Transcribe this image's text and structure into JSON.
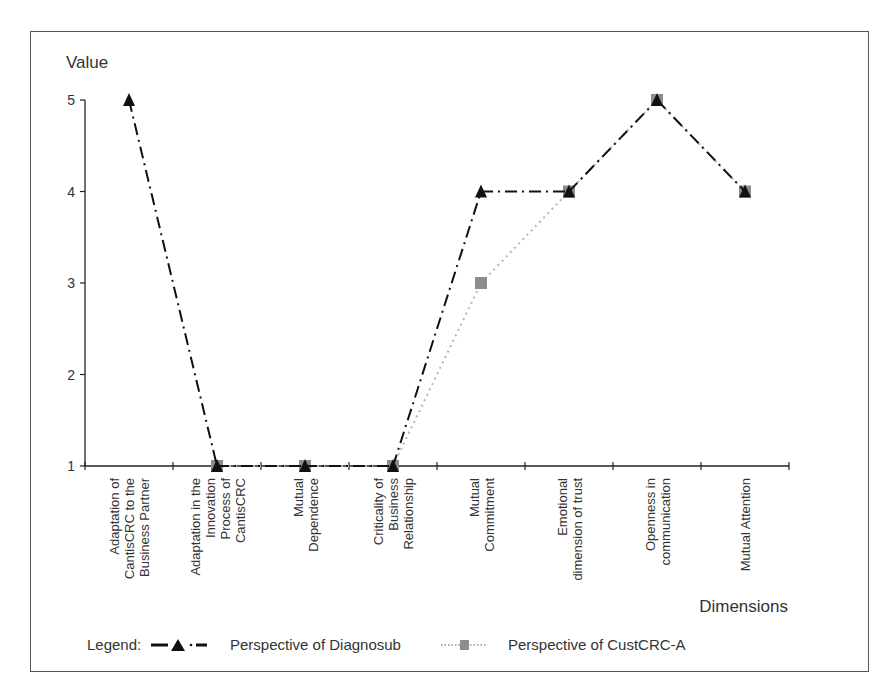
{
  "chart_data": {
    "type": "line",
    "title": "",
    "ylabel": "Value",
    "xlabel": "Dimensions",
    "ylim": [
      1,
      5
    ],
    "yticks": [
      1,
      2,
      3,
      4,
      5
    ],
    "grid": false,
    "legend_position": "bottom",
    "legend_prefix": "Legend:",
    "categories": [
      "Adaptation of CantisCRC to the Business Partner",
      "Adaptation in the Innovation Process of CantisCRC",
      "Mutual Dependence",
      "Criticality of Business Relationship",
      "Mutual Commitment",
      "Emotional dimension of trust",
      "Openness in communication",
      "Mutual Attention"
    ],
    "category_lines": [
      [
        "Adaptation of",
        "CantisCRC to the",
        "Business Partner"
      ],
      [
        "Adaptation in the",
        "Innovation",
        "Process of",
        "CantisCRC"
      ],
      [
        "Mutual",
        "Dependence"
      ],
      [
        "Criticality of",
        "Business",
        "Relationship"
      ],
      [
        "Mutual",
        "Commitment"
      ],
      [
        "Emotional",
        "dimension of trust"
      ],
      [
        "Openness in",
        "communication"
      ],
      [
        "Mutual Attention"
      ]
    ],
    "series": [
      {
        "name": "Perspective of Diagnosub",
        "marker": "triangle",
        "line_style": "dash-dot",
        "color": "#111111",
        "values": [
          5,
          1,
          1,
          1,
          4,
          4,
          5,
          4
        ]
      },
      {
        "name": "Perspective of CustCRC-A",
        "marker": "square",
        "line_style": "dotted",
        "color": "#8c8c8c",
        "values": [
          null,
          1,
          1,
          1,
          3,
          4,
          5,
          4
        ]
      }
    ]
  }
}
